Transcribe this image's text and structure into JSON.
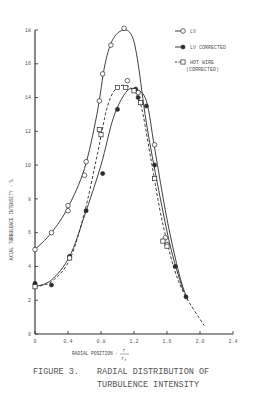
{
  "chart_data": {
    "type": "scatter",
    "xlabel": "RADIAL POSITION - r/r0",
    "ylabel": "AXIAL TURBULENCE INTENSITY - %",
    "xlim": [
      0,
      2.4
    ],
    "ylim": [
      0,
      18
    ],
    "xticks": [
      0,
      0.4,
      0.8,
      1.2,
      1.6,
      2.0,
      2.4
    ],
    "yticks": [
      0,
      2,
      4,
      6,
      8,
      10,
      12,
      14,
      16,
      18
    ],
    "grid": false,
    "legend_position": "upper right",
    "series": [
      {
        "name": "LV",
        "marker": "open-circle",
        "line": "solid",
        "points": [
          [
            0,
            5.0
          ],
          [
            0.2,
            6.0
          ],
          [
            0.4,
            7.6
          ],
          [
            0.4,
            7.3
          ],
          [
            0.6,
            9.4
          ],
          [
            0.62,
            10.2
          ],
          [
            0.78,
            13.8
          ],
          [
            0.82,
            15.4
          ],
          [
            0.92,
            17.1
          ],
          [
            1.08,
            18.1
          ],
          [
            1.12,
            15.0
          ],
          [
            1.25,
            14.3
          ],
          [
            1.45,
            11.2
          ],
          [
            1.58,
            5.7
          ],
          [
            1.6,
            5.3
          ]
        ],
        "curve": [
          [
            0,
            5.0
          ],
          [
            0.2,
            6.0
          ],
          [
            0.4,
            7.5
          ],
          [
            0.6,
            9.8
          ],
          [
            0.75,
            13.0
          ],
          [
            0.85,
            16.0
          ],
          [
            0.95,
            17.5
          ],
          [
            1.08,
            18.0
          ],
          [
            1.18,
            17.6
          ],
          [
            1.25,
            16.0
          ],
          [
            1.35,
            12.5
          ],
          [
            1.5,
            8.5
          ],
          [
            1.65,
            5.0
          ],
          [
            1.8,
            2.5
          ]
        ]
      },
      {
        "name": "LV CORRECTED",
        "marker": "filled-circle",
        "line": "solid",
        "points": [
          [
            0,
            3.0
          ],
          [
            0.2,
            2.9
          ],
          [
            0.42,
            4.6
          ],
          [
            0.62,
            7.3
          ],
          [
            0.82,
            9.5
          ],
          [
            1.0,
            13.3
          ],
          [
            1.22,
            14.5
          ],
          [
            1.25,
            14.0
          ],
          [
            1.35,
            13.5
          ],
          [
            1.45,
            10.0
          ],
          [
            1.7,
            4.0
          ],
          [
            1.83,
            2.2
          ]
        ],
        "curve": [
          [
            0,
            2.8
          ],
          [
            0.2,
            3.2
          ],
          [
            0.42,
            4.6
          ],
          [
            0.6,
            7.0
          ],
          [
            0.8,
            10.0
          ],
          [
            0.95,
            12.8
          ],
          [
            1.1,
            14.3
          ],
          [
            1.22,
            14.5
          ],
          [
            1.35,
            13.8
          ],
          [
            1.45,
            11.0
          ],
          [
            1.6,
            6.8
          ],
          [
            1.75,
            3.5
          ],
          [
            1.85,
            2.0
          ]
        ]
      },
      {
        "name": "HOT WIRE (CORRECTED)",
        "marker": "open-square",
        "line": "dashed",
        "points": [
          [
            0,
            2.8
          ],
          [
            0.42,
            4.5
          ],
          [
            0.78,
            12.1
          ],
          [
            0.8,
            11.8
          ],
          [
            1.0,
            14.6
          ],
          [
            1.1,
            14.6
          ],
          [
            1.2,
            14.4
          ],
          [
            1.28,
            13.7
          ],
          [
            1.45,
            9.2
          ],
          [
            1.55,
            5.5
          ],
          [
            1.6,
            5.2
          ]
        ],
        "curve": [
          [
            0,
            2.8
          ],
          [
            0.2,
            3.1
          ],
          [
            0.42,
            4.4
          ],
          [
            0.6,
            7.2
          ],
          [
            0.75,
            10.5
          ],
          [
            0.88,
            13.5
          ],
          [
            1.0,
            14.6
          ],
          [
            1.15,
            14.6
          ],
          [
            1.28,
            13.6
          ],
          [
            1.4,
            10.5
          ],
          [
            1.55,
            6.5
          ],
          [
            1.75,
            3.0
          ],
          [
            2.05,
            0.5
          ]
        ]
      }
    ]
  },
  "legend": {
    "items": [
      {
        "label": "LV",
        "marker": "open-circle",
        "line": "solid"
      },
      {
        "label": "LV CORRECTED",
        "marker": "filled-circle",
        "line": "solid"
      },
      {
        "label": "HOT WIRE",
        "label2": "(CORRECTED)",
        "marker": "open-square",
        "line": "dashed"
      }
    ]
  },
  "axes": {
    "y_label": "AXIAL TURBULENCE INTENSITY - %",
    "x_label": "RADIAL POSITION -",
    "x_label_frac_num": "r",
    "x_label_frac_den": "r₀",
    "x_ticks": [
      "0",
      "0.4",
      "0.8",
      "1.2",
      "1.6",
      "2.0",
      "2.4"
    ],
    "y_ticks": [
      "0",
      "2",
      "4",
      "6",
      "8",
      "10",
      "12",
      "14",
      "16",
      "18"
    ]
  },
  "caption": {
    "figure_number": "FIGURE 3.",
    "line1": "RADIAL DISTRIBUTION OF",
    "line2": "TURBULENCE INTENSITY"
  }
}
